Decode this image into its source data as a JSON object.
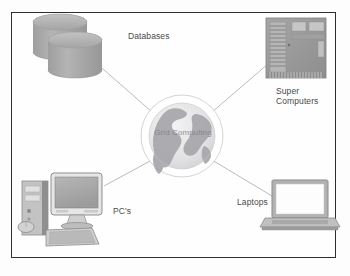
{
  "figure": {
    "border_color": "#2e2e2e",
    "background": "#fefefe"
  },
  "center": {
    "label": "Grid Computing",
    "icon": "globe-icon",
    "color": "#8d8d95"
  },
  "nodes": [
    {
      "id": "databases",
      "label": "Databases",
      "icon": "database-cylinders-icon",
      "color": "#a8a8a8"
    },
    {
      "id": "super-computers",
      "label": "Super\nComputers",
      "icon": "server-rack-icon",
      "color": "#9a9a9a"
    },
    {
      "id": "laptops",
      "label": "Laptops",
      "icon": "laptop-icon",
      "color": "#9e9e9e"
    },
    {
      "id": "pcs",
      "label": "PC's",
      "icon": "desktop-computer-icon",
      "color": "#9c9c9c"
    }
  ],
  "connectors": {
    "count": 4,
    "color": "#b0b0b0",
    "style": "thin-line"
  }
}
